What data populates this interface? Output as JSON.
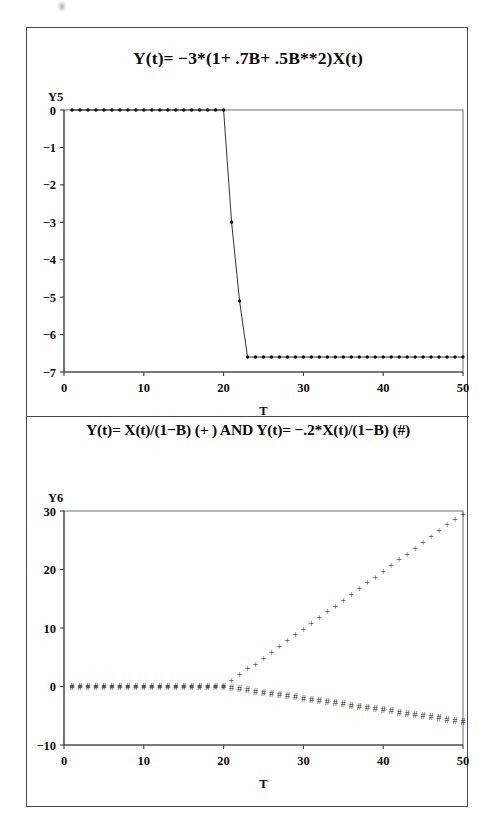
{
  "figure": {
    "panels": [
      {
        "id": "panel-top",
        "title": "Y(t)= −3*(1+ .7B+ .5B**2)X(t)",
        "ylabel": "Y5",
        "xlabel": "T"
      },
      {
        "id": "panel-bottom",
        "title": "Y(t)= X(t)/(1−B)  (+ )  AND  Y(t)= −.2*X(t)/(1−B)  (#)",
        "ylabel": "Y6",
        "xlabel": "T"
      }
    ]
  },
  "chart_data": [
    {
      "type": "line",
      "title": "Y(t)= −3*(1+ .7B+ .5B**2)X(t)",
      "xlabel": "T",
      "ylabel": "Y5",
      "xlim": [
        0,
        50
      ],
      "ylim": [
        -7,
        0
      ],
      "xticks": [
        0,
        10,
        20,
        30,
        40,
        50
      ],
      "xtick_labels": [
        "0",
        "10",
        "20",
        "30",
        "40",
        "50"
      ],
      "yticks": [
        0,
        -1,
        -2,
        -3,
        -4,
        -5,
        -6,
        -7
      ],
      "ytick_labels": [
        "0",
        "−1",
        "−2",
        "−3",
        "−4",
        "−5",
        "−6",
        "−7"
      ],
      "grid": false,
      "legend": null,
      "marker": "dot",
      "series": [
        {
          "name": "Y5",
          "x": [
            1,
            2,
            3,
            4,
            5,
            6,
            7,
            8,
            9,
            10,
            11,
            12,
            13,
            14,
            15,
            16,
            17,
            18,
            19,
            20,
            21,
            22,
            23,
            24,
            25,
            26,
            27,
            28,
            29,
            30,
            31,
            32,
            33,
            34,
            35,
            36,
            37,
            38,
            39,
            40,
            41,
            42,
            43,
            44,
            45,
            46,
            47,
            48,
            49,
            50
          ],
          "values": [
            0,
            0,
            0,
            0,
            0,
            0,
            0,
            0,
            0,
            0,
            0,
            0,
            0,
            0,
            0,
            0,
            0,
            0,
            0,
            0,
            -3.0,
            -5.1,
            -6.6,
            -6.6,
            -6.6,
            -6.6,
            -6.6,
            -6.6,
            -6.6,
            -6.6,
            -6.6,
            -6.6,
            -6.6,
            -6.6,
            -6.6,
            -6.6,
            -6.6,
            -6.6,
            -6.6,
            -6.6,
            -6.6,
            -6.6,
            -6.6,
            -6.6,
            -6.6,
            -6.6,
            -6.6,
            -6.6,
            -6.6,
            -6.6
          ]
        }
      ]
    },
    {
      "type": "scatter",
      "title": "Y(t)= X(t)/(1−B)  (+ )  AND  Y(t)= −.2*X(t)/(1−B)  (#)",
      "xlabel": "T",
      "ylabel": "Y6",
      "xlim": [
        0,
        50
      ],
      "ylim": [
        -10,
        30
      ],
      "xticks": [
        0,
        10,
        20,
        30,
        40,
        50
      ],
      "xtick_labels": [
        "0",
        "10",
        "20",
        "30",
        "40",
        "50"
      ],
      "yticks": [
        30,
        20,
        10,
        0,
        -10
      ],
      "ytick_labels": [
        "30",
        "20",
        "10",
        "0",
        "−10"
      ],
      "grid": false,
      "legend": null,
      "series": [
        {
          "name": "Y(t)= X(t)/(1−B)",
          "marker": "+",
          "x": [
            1,
            2,
            3,
            4,
            5,
            6,
            7,
            8,
            9,
            10,
            11,
            12,
            13,
            14,
            15,
            16,
            17,
            18,
            19,
            20,
            21,
            22,
            23,
            24,
            25,
            26,
            27,
            28,
            29,
            30,
            31,
            32,
            33,
            34,
            35,
            36,
            37,
            38,
            39,
            40,
            41,
            42,
            43,
            44,
            45,
            46,
            47,
            48,
            49,
            50
          ],
          "values": [
            0,
            0,
            0,
            0,
            0,
            0,
            0,
            0,
            0,
            0,
            0,
            0,
            0,
            0,
            0,
            0,
            0,
            0,
            0,
            0,
            1.0,
            2.0,
            3.0,
            3.8,
            4.8,
            5.8,
            6.8,
            7.8,
            8.8,
            9.8,
            10.8,
            11.8,
            12.8,
            13.7,
            14.7,
            15.7,
            16.7,
            17.7,
            18.7,
            19.7,
            20.7,
            21.7,
            22.6,
            23.6,
            24.6,
            25.6,
            26.6,
            27.6,
            28.5,
            29.4
          ]
        },
        {
          "name": "Y(t)= −.2*X(t)/(1−B)",
          "marker": "#",
          "x": [
            1,
            2,
            3,
            4,
            5,
            6,
            7,
            8,
            9,
            10,
            11,
            12,
            13,
            14,
            15,
            16,
            17,
            18,
            19,
            20,
            21,
            22,
            23,
            24,
            25,
            26,
            27,
            28,
            29,
            30,
            31,
            32,
            33,
            34,
            35,
            36,
            37,
            38,
            39,
            40,
            41,
            42,
            43,
            44,
            45,
            46,
            47,
            48,
            49,
            50
          ],
          "values": [
            0,
            0,
            0,
            0,
            0,
            0,
            0,
            0,
            0,
            0,
            0,
            0,
            0,
            0,
            0,
            0,
            0,
            0,
            0,
            0,
            -0.2,
            -0.4,
            -0.6,
            -0.8,
            -1.0,
            -1.2,
            -1.4,
            -1.6,
            -1.8,
            -2.0,
            -2.2,
            -2.4,
            -2.6,
            -2.8,
            -3.0,
            -3.2,
            -3.4,
            -3.6,
            -3.8,
            -4.0,
            -4.2,
            -4.4,
            -4.6,
            -4.8,
            -5.0,
            -5.2,
            -5.4,
            -5.6,
            -5.8,
            -6.0
          ]
        }
      ]
    }
  ]
}
